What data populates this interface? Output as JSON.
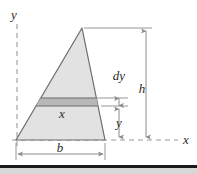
{
  "figure": {
    "background_color": "#ffffff",
    "outline_color": "#6b6b6b",
    "fill_color": "#e2e2e2",
    "strip_fill_color": "#b8b8b8",
    "dimension_line_color": "#8a8a8a",
    "axis_color": "#9a9a9a",
    "label_color": "#2b2b2b"
  },
  "axes": {
    "y_axis_label": "y",
    "x_axis_label": "x",
    "y_axis_style": "dashed",
    "x_axis_style": "dashed"
  },
  "labels": {
    "strip_width": "x",
    "strip_thickness": "dy",
    "total_height": "h",
    "strip_elevation": "y",
    "base_width": "b"
  },
  "geometry": {
    "apex": [
      82,
      28
    ],
    "base_left": [
      16,
      140
    ],
    "base_right": [
      105,
      140
    ],
    "strip_top_y": 98,
    "strip_bottom_y": 106,
    "origin": [
      16,
      140
    ]
  },
  "dimensions": [
    {
      "name": "h",
      "label": "h",
      "orientation": "vertical",
      "from_y": 28,
      "to_y": 140,
      "at_x": 146
    },
    {
      "name": "dy",
      "label": "dy",
      "orientation": "vertical",
      "from_y": 98,
      "to_y": 106,
      "at_x": 119
    },
    {
      "name": "y",
      "label": "y",
      "orientation": "vertical",
      "from_y": 106,
      "to_y": 140,
      "at_x": 119
    },
    {
      "name": "b",
      "label": "b",
      "orientation": "horizontal",
      "from_x": 16,
      "to_x": 105,
      "at_y": 154
    }
  ],
  "bottom_band": {
    "present": true,
    "color_dark": "#1a1a1a",
    "color_light": "#d8d8d8"
  }
}
